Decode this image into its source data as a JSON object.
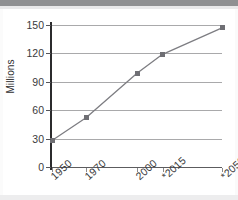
{
  "chart_data": {
    "type": "line",
    "title": "",
    "subtitle": "",
    "xlabel": "",
    "ylabel": "Millions",
    "categories": [
      "1950",
      "1970",
      "2000",
      "*2015",
      "*2050"
    ],
    "x": [
      1950,
      1970,
      2000,
      2015,
      2050
    ],
    "values": [
      28,
      52,
      99,
      119,
      147
    ],
    "series": [
      {
        "name": "Population",
        "values": [
          28,
          52,
          99,
          119,
          147
        ]
      }
    ],
    "ylim": [
      0,
      150
    ],
    "yticks": [
      0,
      30,
      60,
      90,
      120,
      150
    ],
    "ytick_labels": [
      "0",
      "30",
      "60",
      "90",
      "120",
      "150"
    ],
    "xtick_labels": [
      "1950",
      "1970",
      "2000",
      "*2015",
      "*2050"
    ],
    "grid": "horizontal",
    "legend": "none",
    "annotations": [
      "* denotes projected value"
    ],
    "marker": "square",
    "colors": {
      "line": "#7d7d82",
      "marker": "#6f6f74",
      "gridline": "#a9a9ab",
      "axis": "#2b2b2d",
      "text": "#3a3a3c",
      "background": "#ffffff"
    }
  },
  "axis": {
    "y_title": "Millions",
    "ticks_y": [
      {
        "label": "150",
        "value": 150
      },
      {
        "label": "120",
        "value": 120
      },
      {
        "label": "90",
        "value": 90
      },
      {
        "label": "60",
        "value": 60
      },
      {
        "label": "30",
        "value": 30
      },
      {
        "label": "0",
        "value": 0
      }
    ],
    "ticks_x": [
      {
        "label": "1950",
        "value": 1950
      },
      {
        "label": "1970",
        "value": 1970
      },
      {
        "label": "2000",
        "value": 2000
      },
      {
        "label": "*2015",
        "value": 2015
      },
      {
        "label": "*2050",
        "value": 2050
      }
    ]
  }
}
